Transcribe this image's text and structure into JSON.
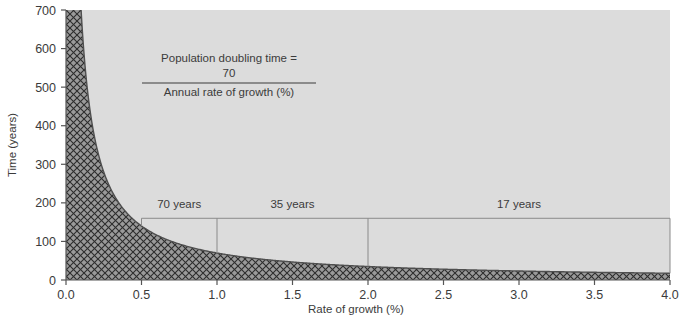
{
  "chart_data": {
    "type": "line",
    "title": "",
    "subtitle": "",
    "xlabel": "Rate of growth (%)",
    "ylabel": "Time (years)",
    "xlim": [
      0.0,
      4.0
    ],
    "ylim": [
      0,
      700
    ],
    "grid": false,
    "legend": null,
    "curve_formula": "y = 70 / x",
    "fill_below_curve": "cross-hatched",
    "xticks": [
      0.0,
      0.5,
      1.0,
      1.5,
      2.0,
      2.5,
      3.0,
      3.5,
      4.0
    ],
    "xtick_labels": [
      "0.0",
      "0.5",
      "1.0",
      "1.5",
      "2.0",
      "2.5",
      "3.0",
      "3.5",
      "4.0"
    ],
    "yticks": [
      0,
      100,
      200,
      300,
      400,
      500,
      600,
      700
    ],
    "ytick_labels": [
      "0",
      "100",
      "200",
      "300",
      "400",
      "500",
      "600",
      "700"
    ],
    "x": [
      0.1,
      0.12,
      0.15,
      0.18,
      0.2,
      0.25,
      0.3,
      0.35,
      0.4,
      0.45,
      0.5,
      0.6,
      0.7,
      0.8,
      0.9,
      1.0,
      1.2,
      1.4,
      1.6,
      1.8,
      2.0,
      2.25,
      2.5,
      2.75,
      3.0,
      3.25,
      3.5,
      3.75,
      4.0
    ],
    "y": [
      700,
      583,
      467,
      389,
      350,
      280,
      233,
      200,
      175,
      156,
      140,
      117,
      100,
      88,
      78,
      70,
      58,
      50,
      44,
      39,
      35,
      31,
      28,
      25,
      23,
      22,
      20,
      19,
      18
    ],
    "annotations": [
      {
        "label": "70 years",
        "x_start": 0.5,
        "x_end": 1.0,
        "level_years": 160
      },
      {
        "label": "35 years",
        "x_start": 1.0,
        "x_end": 2.0,
        "level_years": 160
      },
      {
        "label": "17 years",
        "x_start": 2.0,
        "x_end": 4.0,
        "level_years": 160
      }
    ],
    "formula": {
      "numerator_line1": "Population doubling time =",
      "numerator_line2": "70",
      "denominator": "Annual rate of growth (%)"
    },
    "colors": {
      "plot_background": "#dcdcdc",
      "hatch_fill": "#909090",
      "hatch_line": "#2f2f2f",
      "curve": "#4a4a4a",
      "axis": "#555555",
      "text": "#3b3b3b",
      "annotation_line": "#8a8a8a",
      "page_background": "#ffffff"
    }
  }
}
